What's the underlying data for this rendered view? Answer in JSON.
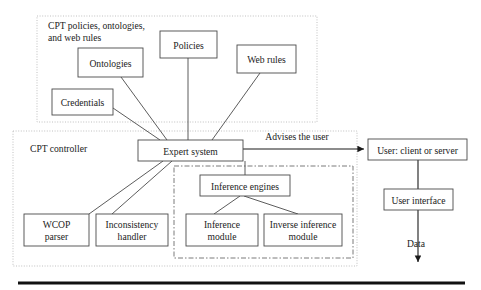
{
  "figure": {
    "containers": [
      {
        "id": "policies-group",
        "label_line1": "CPT policies, ontologies,",
        "label_line2": "and web rules",
        "x": 37,
        "y": 16,
        "w": 280,
        "h": 106
      },
      {
        "id": "cpt-controller",
        "label": "CPT controller",
        "x": 13,
        "y": 131,
        "w": 344,
        "h": 135
      },
      {
        "id": "inference-engines-group",
        "label": "",
        "x": 174,
        "y": 166,
        "w": 179,
        "h": 92
      }
    ],
    "nodes": [
      {
        "id": "ontologies",
        "label": "Ontologies",
        "x": 78,
        "y": 48,
        "w": 65,
        "h": 29
      },
      {
        "id": "policies",
        "label": "Policies",
        "x": 160,
        "y": 31,
        "w": 57,
        "h": 27
      },
      {
        "id": "web-rules",
        "label": "Web rules",
        "x": 237,
        "y": 45,
        "w": 59,
        "h": 28
      },
      {
        "id": "credentials",
        "label": "Credentials",
        "x": 52,
        "y": 89,
        "w": 61,
        "h": 26
      },
      {
        "id": "expert-system",
        "label": "Expert system",
        "x": 138,
        "y": 140,
        "w": 105,
        "h": 21
      },
      {
        "id": "user-client-or-server",
        "label": "User: client or server",
        "x": 368,
        "y": 139,
        "w": 99,
        "h": 21
      },
      {
        "id": "user-interface",
        "label": "User interface",
        "x": 384,
        "y": 189,
        "w": 69,
        "h": 21
      },
      {
        "id": "inference-engines",
        "label": "Inference engines",
        "x": 200,
        "y": 175,
        "w": 90,
        "h": 21
      },
      {
        "id": "wcop-parser",
        "label_line1": "WCOP",
        "label_line2": "parser",
        "x": 24,
        "y": 214,
        "w": 65,
        "h": 32
      },
      {
        "id": "inconsistency-handler",
        "label_line1": "Inconsistency",
        "label_line2": "handler",
        "x": 96,
        "y": 214,
        "w": 72,
        "h": 32
      },
      {
        "id": "inference-module",
        "label_line1": "Inference",
        "label_line2": "module",
        "x": 186,
        "y": 214,
        "w": 72,
        "h": 32
      },
      {
        "id": "inverse-inference-module",
        "label_line1": "Inverse inference",
        "label_line2": "module",
        "x": 264,
        "y": 214,
        "w": 78,
        "h": 32
      }
    ],
    "edge_labels": [
      {
        "id": "advises-the-user",
        "text": "Advises the user",
        "x": 297,
        "y": 138
      },
      {
        "id": "data",
        "text": "Data",
        "x": 416,
        "y": 244
      }
    ],
    "links": [
      {
        "id": "ontologies-to-expert-system",
        "x1": 121,
        "y1": 77,
        "x2": 167,
        "y2": 140
      },
      {
        "id": "policies-to-expert-system",
        "x1": 188,
        "y1": 58,
        "x2": 188,
        "y2": 140
      },
      {
        "id": "web-rules-to-expert-system",
        "x1": 260,
        "y1": 73,
        "x2": 212,
        "y2": 140
      },
      {
        "id": "credentials-to-expert-system",
        "x1": 113,
        "y1": 108,
        "x2": 160,
        "y2": 140
      },
      {
        "id": "expert-system-to-wcop-parser",
        "x1": 163,
        "y1": 161,
        "x2": 89,
        "y2": 214
      },
      {
        "id": "expert-system-to-inconsistency-handler",
        "x1": 172,
        "y1": 161,
        "x2": 112,
        "y2": 214
      },
      {
        "id": "expert-system-to-inference-engines",
        "x1": 245,
        "y1": 161,
        "x2": 245,
        "y2": 175
      },
      {
        "id": "inference-engines-to-inference-module",
        "x1": 240,
        "y1": 196,
        "x2": 214,
        "y2": 214
      },
      {
        "id": "inference-engines-to-inverse-inference-module",
        "x1": 244,
        "y1": 196,
        "x2": 298,
        "y2": 214
      }
    ],
    "arrows": [
      {
        "id": "expert-system-to-user",
        "x1": 243,
        "y1": 149,
        "x2": 366,
        "y2": 149
      },
      {
        "id": "user-to-user-interface",
        "x1": 418,
        "y1": 160,
        "x2": 418,
        "y2": 189
      },
      {
        "id": "user-interface-to-data",
        "x1": 418,
        "y1": 210,
        "x2": 418,
        "y2": 265
      }
    ],
    "bottom_rule": {
      "id": "bottom-rule",
      "x1": 18,
      "y1": 283,
      "x2": 465,
      "y2": 283
    },
    "colors": {
      "node_stroke": "#4a4a4a",
      "container_stroke": "#b9b9b9",
      "dashdot_stroke": "#6b6b6b",
      "text": "#1b1b1b",
      "rule": "#111111",
      "background": "#ffffff"
    }
  }
}
